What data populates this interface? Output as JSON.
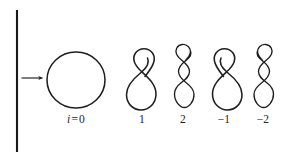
{
  "figure": {
    "background_color": "#ffffff",
    "ink_color": "#211e1e",
    "width": 291,
    "height": 163
  },
  "wall": {
    "name": "vertical-boundary-line",
    "x": 17,
    "y_top": 10,
    "y_bottom": 152,
    "color": "#1a1818"
  },
  "arrow": {
    "name": "incoming-arrow",
    "x_start": 21,
    "x_end": 43,
    "y": 78,
    "direction": "right",
    "color": "#211e1e"
  },
  "curves": [
    {
      "id": "curve-0",
      "label_html": "i = 0",
      "label_variable": "i",
      "label_operator": "=",
      "label_value": "0",
      "rotation_index": 0,
      "crossings": 0,
      "shape": "circle",
      "center_x": 76,
      "center_y": 80,
      "radius_x": 29,
      "radius_y": 28,
      "label_x": 76,
      "label_y": 121
    },
    {
      "id": "curve-1",
      "label_html": "1",
      "label_value": "1",
      "rotation_index": 1,
      "crossings": 1,
      "shape": "figure-eight",
      "center_x": 144,
      "center_y": 80,
      "label_x": 142,
      "label_y": 121
    },
    {
      "id": "curve-2",
      "label_html": "2",
      "label_value": "2",
      "rotation_index": 2,
      "crossings": 2,
      "shape": "double-twist",
      "center_x": 184,
      "center_y": 77,
      "label_x": 183,
      "label_y": 121
    },
    {
      "id": "curve-minus-1",
      "label_html": "−1",
      "label_value": "−1",
      "rotation_index": -1,
      "crossings": 1,
      "shape": "figure-eight-mirrored",
      "center_x": 225,
      "center_y": 80,
      "label_x": 224,
      "label_y": 121
    },
    {
      "id": "curve-minus-2",
      "label_html": "−2",
      "label_value": "−2",
      "rotation_index": -2,
      "crossings": 2,
      "shape": "double-twist-mirrored",
      "center_x": 264,
      "center_y": 77,
      "label_x": 263,
      "label_y": 121
    }
  ]
}
